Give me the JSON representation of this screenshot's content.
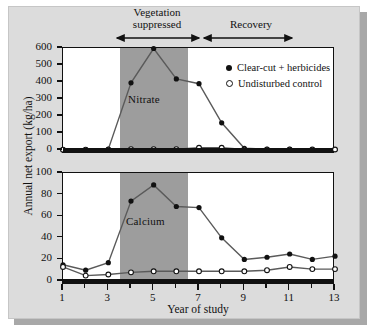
{
  "figure": {
    "ylabel": "Annual net export (kg/ha)",
    "xlabel": "Year of study"
  },
  "annotations": {
    "vegetation": "Vegetation\nsuppressed",
    "vegetation_line1": "Vegetation",
    "vegetation_line2": "suppressed",
    "recovery": "Recovery"
  },
  "legend": {
    "items": [
      {
        "label": "Clear-cut + herbicides",
        "marker": "filled-circle",
        "color": "#111111"
      },
      {
        "label": "Undisturbed control",
        "marker": "open-circle",
        "color": "#111111"
      }
    ]
  },
  "chart_data": [
    {
      "type": "line",
      "title": "Nitrate",
      "xlabel": "Year of study",
      "ylabel": "Annual net export (kg/ha)",
      "xlim": [
        1,
        13
      ],
      "ylim": [
        0,
        600
      ],
      "yticks": [
        0,
        100,
        200,
        300,
        400,
        500,
        600
      ],
      "xticks": [
        1,
        2,
        3,
        4,
        5,
        6,
        7,
        8,
        9,
        10,
        11,
        12,
        13
      ],
      "xticklabels": [
        "1",
        "",
        "3",
        "",
        "5",
        "",
        "7",
        "",
        "9",
        "",
        "11",
        "",
        "13"
      ],
      "grid": false,
      "legend_position": "upper right",
      "shaded_band": {
        "label": "Vegetation suppressed",
        "x_start": 3.5,
        "x_end": 6.5,
        "color": "#9d9d9d"
      },
      "x": [
        1,
        2,
        3,
        4,
        5,
        6,
        7,
        8,
        9,
        10,
        11,
        12,
        13
      ],
      "series": [
        {
          "name": "Clear-cut + herbicides",
          "marker": "filled-circle",
          "values": [
            3,
            2,
            5,
            395,
            597,
            418,
            390,
            160,
            10,
            4,
            4,
            3,
            3
          ]
        },
        {
          "name": "Undisturbed control",
          "marker": "open-circle",
          "values": [
            2,
            2,
            2,
            5,
            5,
            5,
            13,
            13,
            3,
            3,
            3,
            3,
            3
          ]
        }
      ]
    },
    {
      "type": "line",
      "title": "Calcium",
      "xlabel": "Year of study",
      "ylabel": "Annual net export (kg/ha)",
      "xlim": [
        1,
        13
      ],
      "ylim": [
        0,
        100
      ],
      "yticks": [
        0,
        20,
        40,
        60,
        80,
        100
      ],
      "xticks": [
        1,
        2,
        3,
        4,
        5,
        6,
        7,
        8,
        9,
        10,
        11,
        12,
        13
      ],
      "xticklabels": [
        "1",
        "",
        "3",
        "",
        "5",
        "",
        "7",
        "",
        "9",
        "",
        "11",
        "",
        "13"
      ],
      "grid": false,
      "legend_position": "none",
      "shaded_band": {
        "label": "Vegetation suppressed",
        "x_start": 3.5,
        "x_end": 6.5,
        "color": "#9d9d9d"
      },
      "x": [
        1,
        2,
        3,
        4,
        5,
        6,
        7,
        8,
        9,
        10,
        11,
        12,
        13
      ],
      "series": [
        {
          "name": "Clear-cut + herbicides",
          "marker": "filled-circle",
          "values": [
            15,
            10,
            17,
            74,
            89,
            69,
            68,
            40,
            20,
            22,
            25,
            20,
            23
          ]
        },
        {
          "name": "Undisturbed control",
          "marker": "open-circle",
          "values": [
            13,
            5,
            6,
            8,
            9,
            9,
            9,
            9,
            9,
            10,
            13,
            11,
            11
          ]
        }
      ]
    }
  ]
}
